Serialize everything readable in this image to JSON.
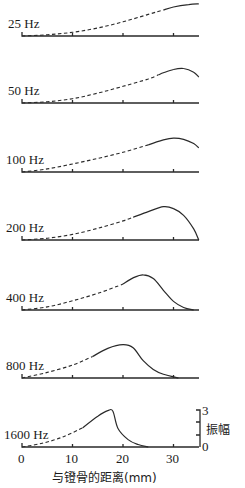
{
  "chart_data": {
    "type": "line",
    "title": "",
    "xlabel": "与镫骨的距离(mm)",
    "ylabel": "振幅",
    "xlim": [
      0,
      35
    ],
    "ylim": [
      0,
      3
    ],
    "x_ticks": [
      0,
      10,
      20,
      30
    ],
    "y_scale_ticks": [
      0,
      3
    ],
    "grid": false,
    "legend": null,
    "note": "Stacked panels of basilar-membrane traveling-wave envelopes; dashed segment = extrapolated portion, solid = measured portion.",
    "series": [
      {
        "name": "25 Hz",
        "peak_mm": 35,
        "peak_amp": 2.6,
        "points": [
          [
            0,
            0
          ],
          [
            5,
            0.1
          ],
          [
            10,
            0.3
          ],
          [
            15,
            0.65
          ],
          [
            20,
            1.15
          ],
          [
            25,
            1.75
          ],
          [
            30,
            2.35
          ],
          [
            33,
            2.55
          ],
          [
            35,
            2.6
          ]
        ],
        "solid_from_mm": 28
      },
      {
        "name": "50 Hz",
        "peak_mm": 32,
        "peak_amp": 2.8,
        "points": [
          [
            0,
            0
          ],
          [
            5,
            0.1
          ],
          [
            10,
            0.35
          ],
          [
            15,
            0.8
          ],
          [
            20,
            1.35
          ],
          [
            25,
            1.95
          ],
          [
            28,
            2.45
          ],
          [
            30,
            2.72
          ],
          [
            32,
            2.8
          ],
          [
            34,
            2.5
          ],
          [
            35,
            2.1
          ]
        ],
        "solid_from_mm": 27
      },
      {
        "name": "100 Hz",
        "peak_mm": 30,
        "peak_amp": 2.75,
        "points": [
          [
            0,
            0
          ],
          [
            5,
            0.25
          ],
          [
            10,
            0.65
          ],
          [
            15,
            1.1
          ],
          [
            20,
            1.6
          ],
          [
            25,
            2.2
          ],
          [
            28,
            2.6
          ],
          [
            30,
            2.75
          ],
          [
            32,
            2.65
          ],
          [
            34,
            2.3
          ],
          [
            35,
            1.95
          ]
        ],
        "solid_from_mm": 25
      },
      {
        "name": "200 Hz",
        "peak_mm": 28,
        "peak_amp": 2.7,
        "points": [
          [
            0,
            0
          ],
          [
            5,
            0.15
          ],
          [
            10,
            0.45
          ],
          [
            15,
            0.95
          ],
          [
            20,
            1.55
          ],
          [
            25,
            2.3
          ],
          [
            28,
            2.7
          ],
          [
            30,
            2.55
          ],
          [
            32,
            2.0
          ],
          [
            34,
            0.9
          ],
          [
            35,
            0
          ]
        ],
        "solid_from_mm": 22
      },
      {
        "name": "400 Hz",
        "peak_mm": 24,
        "peak_amp": 2.85,
        "points": [
          [
            0,
            0
          ],
          [
            5,
            0.25
          ],
          [
            10,
            0.75
          ],
          [
            15,
            1.35
          ],
          [
            20,
            2.1
          ],
          [
            22,
            2.6
          ],
          [
            24,
            2.85
          ],
          [
            26,
            2.55
          ],
          [
            28,
            1.6
          ],
          [
            30,
            0.7
          ],
          [
            32,
            0.2
          ],
          [
            34,
            0
          ]
        ],
        "solid_from_mm": 20
      },
      {
        "name": "800 Hz",
        "peak_mm": 20,
        "peak_amp": 2.7,
        "points": [
          [
            0,
            0
          ],
          [
            5,
            0.45
          ],
          [
            10,
            1.05
          ],
          [
            14,
            1.75
          ],
          [
            17,
            2.4
          ],
          [
            20,
            2.7
          ],
          [
            22,
            2.45
          ],
          [
            24,
            1.4
          ],
          [
            26,
            0.7
          ],
          [
            28,
            0.3
          ],
          [
            31,
            0
          ]
        ],
        "solid_from_mm": 14
      },
      {
        "name": "1600 Hz",
        "peak_mm": 17,
        "peak_amp": 3.0,
        "points": [
          [
            0,
            0
          ],
          [
            4,
            0.3
          ],
          [
            8,
            0.8
          ],
          [
            12,
            1.55
          ],
          [
            15,
            2.5
          ],
          [
            17,
            2.95
          ],
          [
            18,
            2.9
          ],
          [
            19,
            1.5
          ],
          [
            21,
            0.6
          ],
          [
            23,
            0.2
          ],
          [
            25,
            0
          ]
        ],
        "solid_from_mm": 12
      }
    ]
  },
  "labels": {
    "freq": [
      "25 Hz",
      "50 Hz",
      "100 Hz",
      "200 Hz",
      "400 Hz",
      "800 Hz",
      "1600 Hz"
    ],
    "x_ticks": [
      "0",
      "10",
      "20",
      "30"
    ],
    "scale_top": "3",
    "scale_bottom": "0",
    "ylabel": "振幅",
    "xlabel": "与镫骨的距离(mm)"
  },
  "colors": {
    "ink": "#2a2a2a",
    "background": "#ffffff"
  }
}
